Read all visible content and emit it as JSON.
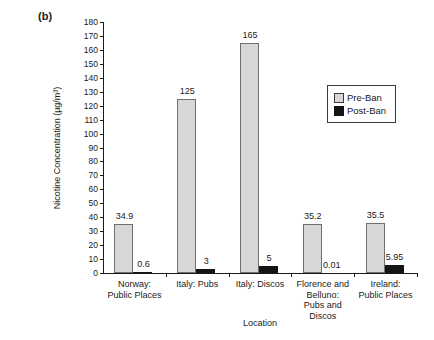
{
  "figure_label": "(b)",
  "colors": {
    "pre_ban_fill": "#d7d7d7",
    "pre_ban_border": "#6f6f6f",
    "post_ban_fill": "#141414",
    "post_ban_border": "#141414",
    "axis": "#1a1a1a",
    "background": "#ffffff",
    "text": "#1a1a1a"
  },
  "chart_data": {
    "type": "bar",
    "title": "",
    "xlabel": "Location",
    "ylabel": "Nicotine Concentration (µg/m³)",
    "ylim": [
      0,
      180
    ],
    "ytick_step": 10,
    "grid": false,
    "legend_position": "upper right inside",
    "categories": [
      "Norway: Public Places",
      "Italy: Pubs",
      "Italy: Discos",
      "Florence and Belluno: Pubs and Discos",
      "Ireland: Public Places"
    ],
    "categories_lines": [
      [
        "Norway:",
        "Public Places"
      ],
      [
        "Italy: Pubs"
      ],
      [
        "Italy: Discos"
      ],
      [
        "Florence and",
        "Belluno:",
        "Pubs and",
        "Discos"
      ],
      [
        "Ireland:",
        "Public Places"
      ]
    ],
    "series": [
      {
        "name": "Pre-Ban",
        "values": [
          34.9,
          125,
          165,
          35.2,
          35.5
        ],
        "labels": [
          "34.9",
          "125",
          "165",
          "35.2",
          "35.5"
        ]
      },
      {
        "name": "Post-Ban",
        "values": [
          0.6,
          3,
          5,
          0.01,
          5.95
        ],
        "labels": [
          "0.6",
          "3",
          "5",
          "0.01",
          "5.95"
        ]
      }
    ]
  }
}
